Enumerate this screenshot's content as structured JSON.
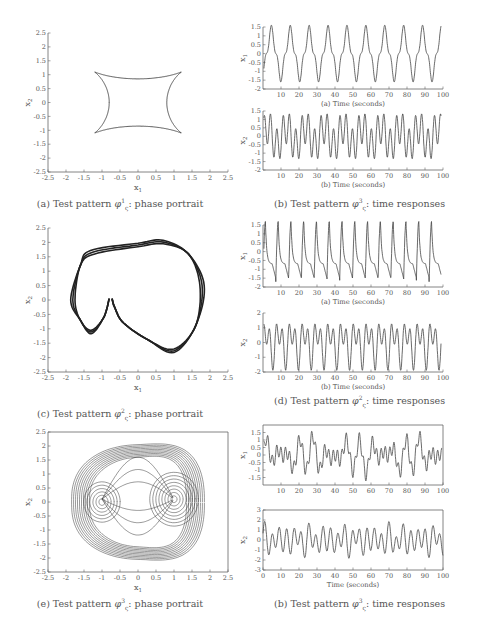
{
  "figure": {
    "rows": [
      {
        "left": {
          "caption": {
            "prefix": "(a) Test pattern ",
            "sym": "φ",
            "sup": "1",
            "sub": "ς",
            "suffix": ": phase portrait"
          },
          "xlabel": "x1",
          "ylabel": "x2"
        },
        "right": {
          "caption": {
            "prefix": "(b) Test pattern ",
            "sym": "φ",
            "sup": "3",
            "sub": "ς",
            "suffix": ": time responses"
          },
          "top_xlabel": "(a) Time (seconds)",
          "bottom_xlabel": "(b) Time (seconds)"
        }
      },
      {
        "left": {
          "caption": {
            "prefix": "(c) Test pattern ",
            "sym": "φ",
            "sup": "2",
            "sub": "ς",
            "suffix": ": phase portrait"
          },
          "xlabel": "x1",
          "ylabel": "x2"
        },
        "right": {
          "caption": {
            "prefix": "(d) Test pattern ",
            "sym": "φ",
            "sup": "2",
            "sub": "ς",
            "suffix": ": time responses"
          },
          "top_xlabel": "(a) Time (seconds)",
          "bottom_xlabel": "(b) Time (seconds)"
        }
      },
      {
        "left": {
          "caption": {
            "prefix": "(e) Test pattern ",
            "sym": "φ",
            "sup": "3",
            "sub": "ς",
            "suffix": ": phase portrait"
          },
          "xlabel": "x1",
          "ylabel": "x2"
        },
        "right": {
          "caption": {
            "prefix": "(b) Test pattern ",
            "sym": "φ",
            "sup": "3",
            "sub": "ς",
            "suffix": ": time responses"
          },
          "top_xlabel": "",
          "bottom_xlabel": "Time (seconds)"
        }
      }
    ]
  },
  "chart_data": [
    {
      "id": "a",
      "type": "line",
      "title": "(a) Test pattern φς1: phase portrait",
      "xlabel": "x1",
      "ylabel": "x2",
      "xlim": [
        -2.5,
        2.5
      ],
      "ylim": [
        -2.5,
        2.5
      ],
      "xticks": [
        "-2.5",
        "-2",
        "-1.5",
        "-1",
        "-0.5",
        "0",
        "0.5",
        "1",
        "1.5",
        "2",
        "2.5"
      ],
      "yticks": [
        "2.5",
        "2",
        "1.5",
        "1",
        "0.5",
        "0",
        "-0.5",
        "-1",
        "-1.5",
        "-2",
        "-2.5"
      ],
      "description": "closed limit cycle with two inner loops near x1=-1 and x1=1; x1 range about -1.6..1.6, x2 range about -1.45..1.45",
      "grid": false,
      "box": false
    },
    {
      "id": "b1",
      "type": "line",
      "title": "(b) Test pattern φς3: time responses",
      "panels": [
        {
          "ylabel": "x1",
          "xlabel": "(a) Time (seconds)",
          "xlim": [
            0,
            100
          ],
          "ylim": [
            -2,
            1.5
          ],
          "xticks": [
            "10",
            "20",
            "30",
            "40",
            "50",
            "60",
            "70",
            "80",
            "90",
            "100"
          ],
          "yticks": [
            "1.5",
            "1",
            "0.5",
            "0",
            "-0.5",
            "-1",
            "-1.5",
            "-2"
          ],
          "period_s": 10.5,
          "peak": 1.55,
          "trough": -1.6
        },
        {
          "ylabel": "x2",
          "xlabel": "(b) Time (seconds)",
          "xlim": [
            0,
            100
          ],
          "ylim": [
            -2,
            1.5
          ],
          "xticks": [
            "10",
            "20",
            "30",
            "40",
            "50",
            "60",
            "70",
            "80",
            "90",
            "100"
          ],
          "yticks": [
            "1.5",
            "1",
            "0.5",
            "0",
            "-0.5",
            "-1",
            "-1.5",
            "-2"
          ],
          "period_s": 10.5,
          "peak": 1.5,
          "trough": -1.5
        }
      ]
    },
    {
      "id": "c",
      "type": "line",
      "title": "(c) Test pattern φς2: phase portrait",
      "xlabel": "x1",
      "ylabel": "x2",
      "xlim": [
        -2.5,
        2.5
      ],
      "ylim": [
        -2.5,
        2.5
      ],
      "xticks": [
        "-2.5",
        "-2",
        "-1.5",
        "-1",
        "-0.5",
        "0",
        "0.5",
        "1",
        "1.5",
        "2",
        "2.5"
      ],
      "yticks": [
        "2.5",
        "2",
        "1.5",
        "1",
        "0.5",
        "0",
        "-0.5",
        "-1",
        "-1.5",
        "-2",
        "-2.5"
      ],
      "description": "thick heart-shaped limit cycle with cusp near (-0.75, 0); x1 range about -1.8..1.75, x2 range about -1.75..2.0",
      "grid": false,
      "box": false
    },
    {
      "id": "d",
      "type": "line",
      "title": "(d) Test pattern φς2: time responses",
      "panels": [
        {
          "ylabel": "x1",
          "xlabel": "(a) Time (seconds)",
          "xlim": [
            0,
            100
          ],
          "ylim": [
            -2,
            1.5
          ],
          "xticks": [
            "10",
            "20",
            "30",
            "40",
            "50",
            "60",
            "70",
            "80",
            "90",
            "100"
          ],
          "yticks": [
            "1.5",
            "1",
            "0.5",
            "0",
            "-0.5",
            "-1",
            "-1.5",
            "-2"
          ],
          "period_s": 7.1,
          "peak": 1.7,
          "trough": -1.75
        },
        {
          "ylabel": "x2",
          "xlabel": "(b) Time (seconds)",
          "xlim": [
            0,
            100
          ],
          "ylim": [
            -2,
            2
          ],
          "xticks": [
            "10",
            "20",
            "30",
            "40",
            "50",
            "60",
            "70",
            "80",
            "90",
            "100"
          ],
          "yticks": [
            "2",
            "1",
            "0",
            "-1",
            "-2"
          ],
          "period_s": 7.1,
          "peak": 2.0,
          "trough": -1.7
        }
      ]
    },
    {
      "id": "e",
      "type": "line",
      "title": "(e) Test pattern φς3: phase portrait",
      "xlabel": "x1",
      "ylabel": "x2",
      "xlim": [
        -2.5,
        2.5
      ],
      "ylim": [
        -2.5,
        2.5
      ],
      "xticks": [
        "-2.5",
        "-2",
        "-1.5",
        "-1",
        "-0.5",
        "0",
        "0.5",
        "1",
        "1.5",
        "2",
        "2.5"
      ],
      "yticks": [
        "2.5",
        "2",
        "1.5",
        "1",
        "0.5",
        "0",
        "-0.5",
        "-1",
        "-1.5",
        "-2",
        "-2.5"
      ],
      "description": "chaotic double-scroll attractor with spiral centers near (-1, 0) and (1, 0); x1 range about -1.9..1.9, x2 range about -2.1..2.1",
      "grid": false,
      "box": true
    },
    {
      "id": "f",
      "type": "line",
      "title": "(b) Test pattern φς3: time responses",
      "panels": [
        {
          "ylabel": "x1",
          "xlabel": "",
          "xlim": [
            0,
            100
          ],
          "ylim": [
            -2,
            2
          ],
          "xticks": [
            "10",
            "20",
            "30",
            "40",
            "50",
            "60",
            "70",
            "80",
            "90",
            "100"
          ],
          "yticks": [
            "1.5",
            "1",
            "0.5",
            "0",
            "-0.5",
            "-1",
            "-1.5"
          ],
          "description": "irregular chaotic oscillation between about -1.8 and 1.8"
        },
        {
          "ylabel": "x2",
          "xlabel": "Time (seconds)",
          "xlim": [
            0,
            100
          ],
          "ylim": [
            -3,
            3
          ],
          "xticks": [
            "0",
            "10",
            "20",
            "30",
            "40",
            "50",
            "60",
            "70",
            "80",
            "90",
            "100"
          ],
          "yticks": [
            "3",
            "2",
            "1",
            "0",
            "-1",
            "-2",
            "-3"
          ],
          "description": "irregular chaotic oscillation between about -2.2 and 2.2"
        }
      ]
    }
  ]
}
